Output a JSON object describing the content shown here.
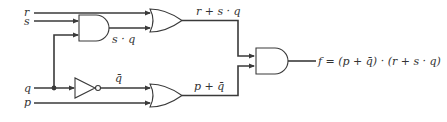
{
  "diagram": {
    "type": "logic-circuit",
    "inputs": [
      {
        "name": "r"
      },
      {
        "name": "s"
      },
      {
        "name": "q"
      },
      {
        "name": "p"
      }
    ],
    "gates": [
      {
        "id": "and1",
        "type": "AND",
        "inputs": [
          "s",
          "q"
        ],
        "output_label": "s · q"
      },
      {
        "id": "or1",
        "type": "OR",
        "inputs": [
          "r",
          "s · q"
        ],
        "output_label": "r + s · q"
      },
      {
        "id": "not1",
        "type": "NOT",
        "inputs": [
          "q"
        ],
        "output_label": "q̄"
      },
      {
        "id": "or2",
        "type": "OR",
        "inputs": [
          "q̄",
          "p"
        ],
        "output_label": "p + q̄"
      },
      {
        "id": "and2",
        "type": "AND",
        "inputs": [
          "r + s · q",
          "p + q̄"
        ],
        "output_label": "f = (p + q̄) · (r + s · q)"
      }
    ],
    "labels": {
      "r": "r",
      "s": "s",
      "q": "q",
      "p": "p",
      "sq": "s · q",
      "r_plus_sq": "r + s · q",
      "qbar": "q̄",
      "p_plus_qbar": "p + q̄",
      "f": "f = (p + q̄) · (r + s · q)"
    },
    "colors": {
      "line": "#3a3a3a",
      "text": "#333333",
      "background": "#ffffff"
    }
  }
}
